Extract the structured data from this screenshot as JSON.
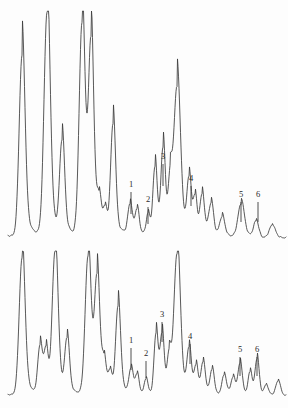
{
  "figure": {
    "background_color": "#fdfdfd",
    "line_color": "#3a3a3a",
    "label_color": "#2b2b2b",
    "width": 288,
    "height": 408
  },
  "chart_data": {
    "type": "line",
    "title": "",
    "subtitle": "",
    "xlabel": "",
    "ylabel": "",
    "grid": false,
    "legend": "none",
    "axis_visible": false,
    "panels": [
      {
        "name": "upper-trace",
        "baseline_y": 238,
        "top_y": 12,
        "x_range": [
          8,
          286
        ],
        "markers": [
          {
            "label": "1",
            "x": 131,
            "label_y": 188,
            "tick_top": 192,
            "tick_bottom": 214
          },
          {
            "label": "2",
            "x": 148,
            "label_y": 203,
            "tick_top": 207,
            "tick_bottom": 224
          },
          {
            "label": "3",
            "x": 163,
            "label_y": 160,
            "tick_top": 164,
            "tick_bottom": 186
          },
          {
            "label": "4",
            "x": 191,
            "label_y": 182,
            "tick_top": 186,
            "tick_bottom": 206
          },
          {
            "label": "5",
            "x": 241,
            "label_y": 198,
            "tick_top": 202,
            "tick_bottom": 222
          },
          {
            "label": "6",
            "x": 258,
            "label_y": 198,
            "tick_top": 202,
            "tick_bottom": 222
          }
        ],
        "peaks": [
          {
            "x": 22,
            "height": 0.79,
            "width": 4.0
          },
          {
            "x": 47,
            "height": 0.98,
            "width": 4.2
          },
          {
            "x": 62,
            "height": 0.4,
            "width": 3.4
          },
          {
            "x": 82,
            "height": 0.93,
            "width": 4.0
          },
          {
            "x": 91,
            "height": 0.82,
            "width": 3.6
          },
          {
            "x": 99,
            "height": 0.14,
            "width": 3.0
          },
          {
            "x": 105,
            "height": 0.1,
            "width": 2.6
          },
          {
            "x": 113,
            "height": 0.48,
            "width": 3.4
          },
          {
            "x": 130,
            "height": 0.13,
            "width": 3.0
          },
          {
            "x": 137,
            "height": 0.11,
            "width": 2.8
          },
          {
            "x": 148,
            "height": 0.09,
            "width": 2.4
          },
          {
            "x": 155,
            "height": 0.3,
            "width": 3.0
          },
          {
            "x": 163,
            "height": 0.38,
            "width": 3.0
          },
          {
            "x": 170,
            "height": 0.22,
            "width": 2.8
          },
          {
            "x": 177,
            "height": 0.65,
            "width": 4.6
          },
          {
            "x": 189,
            "height": 0.24,
            "width": 3.0
          },
          {
            "x": 195,
            "height": 0.16,
            "width": 2.6
          },
          {
            "x": 202,
            "height": 0.18,
            "width": 3.2
          },
          {
            "x": 211,
            "height": 0.14,
            "width": 3.4
          },
          {
            "x": 222,
            "height": 0.09,
            "width": 3.6
          },
          {
            "x": 241,
            "height": 0.15,
            "width": 4.4
          },
          {
            "x": 256,
            "height": 0.07,
            "width": 3.4
          },
          {
            "x": 272,
            "height": 0.05,
            "width": 4.0
          }
        ]
      },
      {
        "name": "lower-trace",
        "baseline_y": 396,
        "top_y": 252,
        "x_range": [
          8,
          286
        ],
        "markers": [
          {
            "label": "1",
            "x": 131,
            "label_y": 344,
            "tick_top": 348,
            "tick_bottom": 370
          },
          {
            "label": "2",
            "x": 146,
            "label_y": 357,
            "tick_top": 361,
            "tick_bottom": 378
          },
          {
            "label": "3",
            "x": 162,
            "label_y": 318,
            "tick_top": 322,
            "tick_bottom": 342
          },
          {
            "label": "4",
            "x": 190,
            "label_y": 340,
            "tick_top": 344,
            "tick_bottom": 364
          },
          {
            "label": "5",
            "x": 240,
            "label_y": 353,
            "tick_top": 357,
            "tick_bottom": 376
          },
          {
            "label": "6",
            "x": 257,
            "label_y": 353,
            "tick_top": 357,
            "tick_bottom": 376
          }
        ],
        "peaks": [
          {
            "x": 22,
            "height": 0.94,
            "width": 4.0
          },
          {
            "x": 40,
            "height": 0.33,
            "width": 3.2
          },
          {
            "x": 46,
            "height": 0.29,
            "width": 2.8
          },
          {
            "x": 55,
            "height": 0.98,
            "width": 4.0
          },
          {
            "x": 67,
            "height": 0.36,
            "width": 3.2
          },
          {
            "x": 88,
            "height": 0.95,
            "width": 4.0
          },
          {
            "x": 97,
            "height": 0.78,
            "width": 3.6
          },
          {
            "x": 104,
            "height": 0.2,
            "width": 2.8
          },
          {
            "x": 110,
            "height": 0.14,
            "width": 2.6
          },
          {
            "x": 118,
            "height": 0.6,
            "width": 3.4
          },
          {
            "x": 131,
            "height": 0.17,
            "width": 2.8
          },
          {
            "x": 137,
            "height": 0.13,
            "width": 2.6
          },
          {
            "x": 146,
            "height": 0.1,
            "width": 2.4
          },
          {
            "x": 156,
            "height": 0.42,
            "width": 2.8
          },
          {
            "x": 162,
            "height": 0.4,
            "width": 2.8
          },
          {
            "x": 169,
            "height": 0.26,
            "width": 2.8
          },
          {
            "x": 177,
            "height": 0.97,
            "width": 4.4
          },
          {
            "x": 189,
            "height": 0.3,
            "width": 3.0
          },
          {
            "x": 196,
            "height": 0.19,
            "width": 2.8
          },
          {
            "x": 203,
            "height": 0.22,
            "width": 3.0
          },
          {
            "x": 212,
            "height": 0.17,
            "width": 3.0
          },
          {
            "x": 224,
            "height": 0.14,
            "width": 3.2
          },
          {
            "x": 233,
            "height": 0.12,
            "width": 3.0
          },
          {
            "x": 240,
            "height": 0.22,
            "width": 3.0
          },
          {
            "x": 250,
            "height": 0.16,
            "width": 2.8
          },
          {
            "x": 257,
            "height": 0.25,
            "width": 2.8
          },
          {
            "x": 266,
            "height": 0.07,
            "width": 3.0
          },
          {
            "x": 278,
            "height": 0.1,
            "width": 3.2
          }
        ]
      }
    ]
  }
}
